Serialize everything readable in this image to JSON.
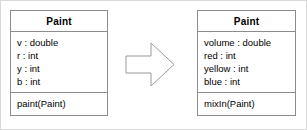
{
  "diagram": {
    "type": "uml-class-refactoring",
    "background_color": "#ffffff",
    "border_color": "#8c8c8c",
    "text_color": "#000000",
    "arrow": {
      "icon": "block-arrow-right-icon",
      "direction": "right",
      "fill": "#ffffff",
      "stroke": "#9a9a9a"
    },
    "classes": [
      {
        "id": "before",
        "name": "Paint",
        "attributes": [
          "v : double",
          "r : int",
          "y : int",
          "b : int"
        ],
        "operations": [
          "paint(Paint)"
        ]
      },
      {
        "id": "after",
        "name": "Paint",
        "attributes": [
          "volume : double",
          "red : int",
          "yellow : int",
          "blue : int"
        ],
        "operations": [
          "mixIn(Paint)"
        ]
      }
    ]
  }
}
